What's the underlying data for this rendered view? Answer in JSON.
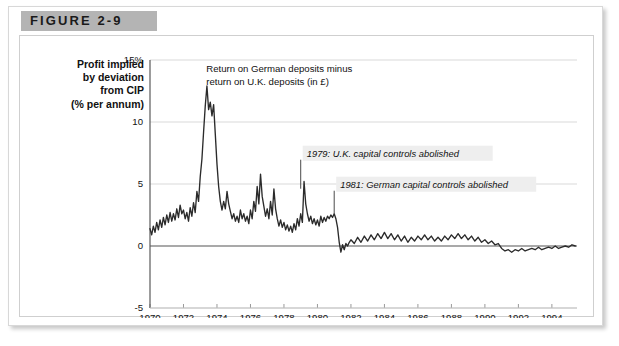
{
  "figure": {
    "tag": "FIGURE 2-9"
  },
  "axis_title": {
    "line1": "Profit implied",
    "line2": "by deviation",
    "line3": "from CIP",
    "line4": "(% per annum)"
  },
  "chart_data": {
    "type": "line",
    "title": "",
    "xlabel": "",
    "ylabel": "Profit implied by deviation from CIP (% per annum)",
    "xlim": [
      1970,
      1995.5
    ],
    "ylim": [
      -5,
      15
    ],
    "grid": true,
    "legend": "none",
    "ytick_labels": [
      "15%",
      "10",
      "5",
      "0",
      "-5"
    ],
    "ytick_values": [
      15,
      10,
      5,
      0,
      -5
    ],
    "xtick_labels": [
      "1970",
      "1972",
      "1974",
      "1976",
      "1978",
      "1980",
      "1982",
      "1984",
      "1986",
      "1988",
      "1990",
      "1992",
      "1994"
    ],
    "xtick_values": [
      1970,
      1972,
      1974,
      1976,
      1978,
      1980,
      1982,
      1984,
      1986,
      1988,
      1990,
      1992,
      1994
    ],
    "series_name": "Return on German deposits minus return on U.K. deposits (in £)",
    "line_color": "#2b2b2b",
    "grid_color": "#d9d9d9",
    "zero_line_color": "#555555",
    "annotations": [
      {
        "id": "series-label",
        "line1": "Return on German deposits minus",
        "line2": "return on U.K. deposits (in £)",
        "x": 1973.0,
        "y": 14.0
      },
      {
        "id": "uk-controls",
        "text": "1979: U.K. capital controls abolished",
        "year": 1979,
        "y": 7.2
      },
      {
        "id": "german-controls",
        "text": "1981: German capital controls abolished",
        "year": 1981,
        "y": 4.7
      }
    ],
    "x": [
      1970.0,
      1970.1,
      1970.2,
      1970.3,
      1970.4,
      1970.5,
      1970.6,
      1970.7,
      1970.8,
      1970.9,
      1971.0,
      1971.1,
      1971.2,
      1971.3,
      1971.4,
      1971.5,
      1971.6,
      1971.7,
      1971.8,
      1971.9,
      1972.0,
      1972.1,
      1972.2,
      1972.3,
      1972.4,
      1972.5,
      1972.6,
      1972.7,
      1972.8,
      1972.9,
      1973.0,
      1973.1,
      1973.2,
      1973.3,
      1973.4,
      1973.5,
      1973.6,
      1973.7,
      1973.8,
      1973.9,
      1974.0,
      1974.1,
      1974.2,
      1974.3,
      1974.4,
      1974.5,
      1974.6,
      1974.7,
      1974.8,
      1974.9,
      1975.0,
      1975.1,
      1975.2,
      1975.3,
      1975.4,
      1975.5,
      1975.6,
      1975.7,
      1975.8,
      1975.9,
      1976.0,
      1976.1,
      1976.2,
      1976.3,
      1976.4,
      1976.5,
      1976.6,
      1976.7,
      1976.8,
      1976.9,
      1977.0,
      1977.1,
      1977.2,
      1977.3,
      1977.4,
      1977.5,
      1977.6,
      1977.7,
      1977.8,
      1977.9,
      1978.0,
      1978.1,
      1978.2,
      1978.3,
      1978.4,
      1978.5,
      1978.6,
      1978.7,
      1978.8,
      1978.9,
      1979.0,
      1979.1,
      1979.2,
      1979.3,
      1979.4,
      1979.5,
      1979.6,
      1979.7,
      1979.8,
      1979.9,
      1980.0,
      1980.1,
      1980.2,
      1980.3,
      1980.4,
      1980.5,
      1980.6,
      1980.7,
      1980.8,
      1980.9,
      1981.0,
      1981.1,
      1981.2,
      1981.3,
      1981.4,
      1981.5,
      1981.6,
      1981.7,
      1981.8,
      1981.9,
      1982.0,
      1982.2,
      1982.4,
      1982.6,
      1982.8,
      1983.0,
      1983.2,
      1983.4,
      1983.6,
      1983.8,
      1984.0,
      1984.2,
      1984.4,
      1984.6,
      1984.8,
      1985.0,
      1985.2,
      1985.4,
      1985.6,
      1985.8,
      1986.0,
      1986.2,
      1986.4,
      1986.6,
      1986.8,
      1987.0,
      1987.2,
      1987.4,
      1987.6,
      1987.8,
      1988.0,
      1988.2,
      1988.4,
      1988.6,
      1988.8,
      1989.0,
      1989.2,
      1989.4,
      1989.6,
      1989.8,
      1990.0,
      1990.2,
      1990.4,
      1990.6,
      1990.8,
      1991.0,
      1991.2,
      1991.4,
      1991.6,
      1991.8,
      1992.0,
      1992.2,
      1992.4,
      1992.6,
      1992.8,
      1993.0,
      1993.2,
      1993.4,
      1993.6,
      1993.8,
      1994.0,
      1994.2,
      1994.4,
      1994.6,
      1994.8,
      1995.0,
      1995.2,
      1995.4
    ],
    "y": [
      1.4,
      0.9,
      1.6,
      1.1,
      1.9,
      1.3,
      2.1,
      1.5,
      2.3,
      1.7,
      2.5,
      1.9,
      2.7,
      2.0,
      2.6,
      2.1,
      3.0,
      2.3,
      3.3,
      2.6,
      2.9,
      2.2,
      2.7,
      2.0,
      3.1,
      2.4,
      3.5,
      2.7,
      4.4,
      3.6,
      5.6,
      7.0,
      9.2,
      11.3,
      12.9,
      11.0,
      11.6,
      10.5,
      11.4,
      9.0,
      6.6,
      4.8,
      3.6,
      2.9,
      3.6,
      3.0,
      4.4,
      3.4,
      2.8,
      2.2,
      2.6,
      2.0,
      2.4,
      1.9,
      2.9,
      2.2,
      2.6,
      2.0,
      2.4,
      1.8,
      2.9,
      2.2,
      3.6,
      2.8,
      4.8,
      3.4,
      5.8,
      4.0,
      3.2,
      2.4,
      3.0,
      2.2,
      3.6,
      2.5,
      4.6,
      3.0,
      2.2,
      1.6,
      2.1,
      1.5,
      1.9,
      1.3,
      1.7,
      1.2,
      1.6,
      1.1,
      1.8,
      1.3,
      2.2,
      1.6,
      2.6,
      1.9,
      5.2,
      3.4,
      2.6,
      2.0,
      2.4,
      1.8,
      2.2,
      1.7,
      2.1,
      1.6,
      2.4,
      1.9,
      2.3,
      2.0,
      2.4,
      2.2,
      2.5,
      2.3,
      2.6,
      2.2,
      1.5,
      0.3,
      -0.5,
      0.1,
      -0.3,
      0.2,
      0.0,
      0.3,
      0.5,
      0.2,
      0.7,
      0.3,
      0.8,
      0.4,
      0.9,
      0.5,
      1.0,
      0.6,
      1.1,
      0.6,
      1.0,
      0.5,
      0.9,
      0.4,
      0.8,
      0.3,
      0.7,
      0.4,
      0.8,
      0.5,
      0.9,
      0.5,
      0.8,
      0.4,
      0.7,
      0.4,
      0.8,
      0.5,
      0.9,
      0.6,
      1.0,
      0.6,
      0.9,
      0.5,
      0.8,
      0.4,
      0.7,
      0.3,
      0.5,
      0.2,
      0.4,
      0.1,
      0.2,
      -0.2,
      -0.4,
      -0.3,
      -0.5,
      -0.3,
      -0.4,
      -0.2,
      -0.4,
      -0.3,
      -0.2,
      -0.3,
      -0.1,
      -0.3,
      -0.2,
      -0.1,
      -0.2,
      0.0,
      -0.2,
      -0.1,
      0.0,
      -0.1,
      0.1,
      0.0
    ]
  }
}
